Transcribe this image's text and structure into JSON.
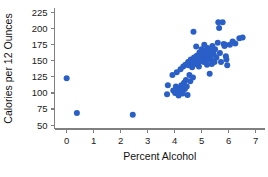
{
  "chart_data": {
    "type": "scatter",
    "title": "",
    "xlabel": "Percent Alcohol",
    "ylabel": "Calories per 12 Ounces",
    "xlim": [
      -0.45,
      7.35
    ],
    "ylim": [
      44,
      232
    ],
    "xticks": [
      0,
      1,
      2,
      3,
      4,
      5,
      6,
      7
    ],
    "xticklabels": [
      "0",
      "1",
      "2",
      "3",
      "4",
      "5",
      "6",
      "7"
    ],
    "yticks": [
      50,
      75,
      100,
      125,
      150,
      175,
      200,
      225
    ],
    "yticklabels": [
      "50",
      "75",
      "100",
      "125",
      "150",
      "175",
      "200",
      "225"
    ],
    "grid": false,
    "legend": false,
    "marker_color": "#2a5fc8",
    "marker_size": 3.0,
    "axis_color": "#808080",
    "points": [
      [
        0.0,
        123
      ],
      [
        0.38,
        69
      ],
      [
        2.45,
        66
      ],
      [
        3.72,
        98
      ],
      [
        3.75,
        112
      ],
      [
        3.92,
        128
      ],
      [
        3.95,
        104
      ],
      [
        4.02,
        100
      ],
      [
        4.05,
        110
      ],
      [
        4.08,
        132
      ],
      [
        4.1,
        99
      ],
      [
        4.12,
        103
      ],
      [
        4.15,
        96
      ],
      [
        4.18,
        108
      ],
      [
        4.2,
        101
      ],
      [
        4.22,
        137
      ],
      [
        4.25,
        112
      ],
      [
        4.28,
        104
      ],
      [
        4.3,
        99
      ],
      [
        4.32,
        141
      ],
      [
        4.35,
        116
      ],
      [
        4.38,
        106
      ],
      [
        4.4,
        144
      ],
      [
        4.42,
        120
      ],
      [
        4.45,
        110
      ],
      [
        4.48,
        97
      ],
      [
        4.5,
        148
      ],
      [
        4.52,
        143
      ],
      [
        4.55,
        128
      ],
      [
        4.58,
        118
      ],
      [
        4.6,
        152
      ],
      [
        4.62,
        146
      ],
      [
        4.65,
        140
      ],
      [
        4.68,
        124
      ],
      [
        4.7,
        195
      ],
      [
        4.72,
        155
      ],
      [
        4.75,
        150
      ],
      [
        4.78,
        145
      ],
      [
        4.8,
        172
      ],
      [
        4.82,
        158
      ],
      [
        4.85,
        152
      ],
      [
        4.88,
        147
      ],
      [
        4.9,
        141
      ],
      [
        4.92,
        163
      ],
      [
        4.95,
        156
      ],
      [
        4.98,
        150
      ],
      [
        5.0,
        168
      ],
      [
        5.02,
        160
      ],
      [
        5.05,
        154
      ],
      [
        5.08,
        148
      ],
      [
        5.1,
        175
      ],
      [
        5.12,
        165
      ],
      [
        5.15,
        158
      ],
      [
        5.18,
        151
      ],
      [
        5.2,
        144
      ],
      [
        5.22,
        170
      ],
      [
        5.25,
        162
      ],
      [
        5.28,
        156
      ],
      [
        5.3,
        130
      ],
      [
        5.32,
        166
      ],
      [
        5.35,
        152
      ],
      [
        5.38,
        145
      ],
      [
        5.4,
        173
      ],
      [
        5.45,
        160
      ],
      [
        5.48,
        148
      ],
      [
        5.5,
        168
      ],
      [
        5.55,
        155
      ],
      [
        5.6,
        178
      ],
      [
        5.62,
        210
      ],
      [
        5.65,
        201
      ],
      [
        5.68,
        162
      ],
      [
        5.72,
        148
      ],
      [
        5.78,
        210
      ],
      [
        5.82,
        176
      ],
      [
        5.85,
        173
      ],
      [
        5.88,
        175
      ],
      [
        5.9,
        157
      ],
      [
        5.92,
        152
      ],
      [
        5.95,
        143
      ],
      [
        6.05,
        175
      ],
      [
        6.15,
        180
      ],
      [
        6.25,
        177
      ],
      [
        6.4,
        185
      ],
      [
        6.52,
        186
      ]
    ]
  }
}
